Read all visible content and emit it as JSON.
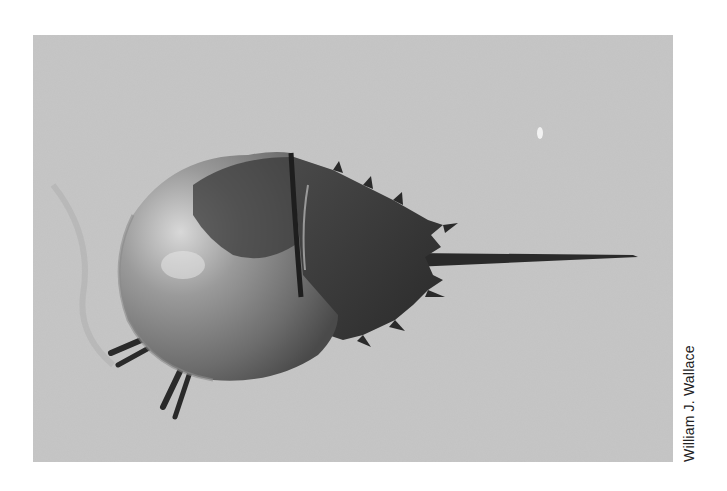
{
  "photo": {
    "subject": "Horseshoe crab on sand",
    "colors": {
      "sand": "#c9c9c9",
      "shell_light": "#b4b4b4",
      "shell_dark": "#2e2e2e",
      "tail": "#2a2a2a"
    }
  },
  "credit": {
    "text": "William J. Wallace"
  }
}
